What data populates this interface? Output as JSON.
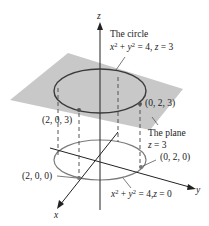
{
  "axes": {
    "x_label": "x",
    "y_label": "y",
    "z_label": "z"
  },
  "labels": {
    "circle_top_title": "The circle",
    "circle_top_eq": {
      "lhs_x": "x",
      "lhs_y": "y",
      "exp": "2",
      "rest": "= 4,",
      "z": "z",
      "z_val": "= 3"
    },
    "plane_title": "The plane",
    "plane_eq": {
      "z": "z",
      "val": "= 3"
    },
    "circle_bottom_eq": {
      "lhs_x": "x",
      "lhs_y": "y",
      "exp": "2",
      "rest": "= 4,",
      "z": "z",
      "z_val": "= 0"
    },
    "point_203": "(2, 0, 3)",
    "point_023": "(0, 2, 3)",
    "point_200": "(2, 0, 0)",
    "point_020": "(0, 2, 0)"
  },
  "colors": {
    "plane_fill": "#c8c8c8",
    "circle_top": "#3a3a3a",
    "circle_bottom": "#7a7a7a",
    "axes": "#222222",
    "point": "#555555"
  }
}
